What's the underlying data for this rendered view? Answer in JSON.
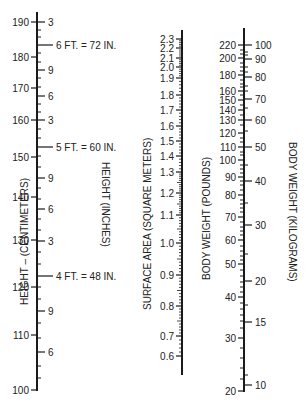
{
  "chart_data": {
    "type": "nomogram",
    "colors": {
      "ink": "#1a1a1a",
      "background": "#ffffff"
    },
    "axes": [
      {
        "id": "height-cm",
        "label": "HEIGHT – (CENTIMETERS)",
        "x": 37,
        "y_top": 12,
        "y_bottom": 391,
        "side": "left",
        "major_ticks": [
          {
            "value": "190",
            "y": 22
          },
          {
            "value": "180",
            "y": 57
          },
          {
            "value": "170",
            "y": 88
          },
          {
            "value": "160",
            "y": 120
          },
          {
            "value": "150",
            "y": 157
          },
          {
            "value": "140",
            "y": 197
          },
          {
            "value": "130",
            "y": 240
          },
          {
            "value": "120",
            "y": 287
          },
          {
            "value": "110",
            "y": 335
          },
          {
            "value": "100",
            "y": 390
          }
        ]
      },
      {
        "id": "height-in",
        "label": "HEIGHT (INCHES)",
        "x": 37,
        "side": "right",
        "major_ticks": [
          {
            "value": "3",
            "y": 22
          },
          {
            "value": "6 FT. = 72 IN.",
            "y": 45,
            "long": true
          },
          {
            "value": "9",
            "y": 70
          },
          {
            "value": "6",
            "y": 96
          },
          {
            "value": "3",
            "y": 120
          },
          {
            "value": "5 FT. = 60 IN.",
            "y": 147,
            "long": true
          },
          {
            "value": "9",
            "y": 178
          },
          {
            "value": "6",
            "y": 209
          },
          {
            "value": "3",
            "y": 241
          },
          {
            "value": "4 FT. = 48 IN.",
            "y": 276,
            "long": true
          },
          {
            "value": "9",
            "y": 311
          },
          {
            "value": "6",
            "y": 352
          }
        ],
        "minor_ticks_y": [
          30,
          37,
          53,
          62,
          78,
          87,
          104,
          112,
          129,
          138,
          156,
          167,
          188,
          199,
          219,
          230,
          252,
          264,
          287,
          299,
          323,
          338,
          366,
          378
        ]
      },
      {
        "id": "surface-area",
        "label": "SURFACE AREA (SQUARE METERS)",
        "x": 182,
        "y_top": 30,
        "y_bottom": 375,
        "side": "left",
        "major_ticks": [
          {
            "value": "2.3",
            "y": 39
          },
          {
            "value": "2.2",
            "y": 48
          },
          {
            "value": "2.1",
            "y": 58
          },
          {
            "value": "2.0",
            "y": 67
          },
          {
            "value": "1.9",
            "y": 78
          },
          {
            "value": "1.8",
            "y": 95
          },
          {
            "value": "1.7",
            "y": 110
          },
          {
            "value": "1.6",
            "y": 126
          },
          {
            "value": "1.5",
            "y": 141
          },
          {
            "value": "1.4",
            "y": 156
          },
          {
            "value": "1.3",
            "y": 172
          },
          {
            "value": "1.2",
            "y": 193
          },
          {
            "value": "1.1",
            "y": 215
          },
          {
            "value": "1.0",
            "y": 243
          },
          {
            "value": "0.9",
            "y": 275
          },
          {
            "value": "0.8",
            "y": 306
          },
          {
            "value": "0.7",
            "y": 336
          },
          {
            "value": "0.6",
            "y": 356
          }
        ]
      },
      {
        "id": "weight-lb",
        "label": "BODY WEIGHT (POUNDS)",
        "x": 244,
        "y_top": 28,
        "y_bottom": 392,
        "side": "left",
        "major_ticks": [
          {
            "value": "220",
            "y": 45
          },
          {
            "value": "200",
            "y": 58
          },
          {
            "value": "180",
            "y": 75
          },
          {
            "value": "160",
            "y": 91
          },
          {
            "value": "150",
            "y": 100
          },
          {
            "value": "140",
            "y": 110
          },
          {
            "value": "130",
            "y": 120
          },
          {
            "value": "120",
            "y": 133
          },
          {
            "value": "110",
            "y": 147
          },
          {
            "value": "100",
            "y": 160
          },
          {
            "value": "90",
            "y": 177
          },
          {
            "value": "80",
            "y": 195
          },
          {
            "value": "70",
            "y": 217
          },
          {
            "value": "60",
            "y": 240
          },
          {
            "value": "50",
            "y": 264
          },
          {
            "value": "40",
            "y": 297
          },
          {
            "value": "30",
            "y": 338
          },
          {
            "value": "20",
            "y": 391
          }
        ],
        "minor_ticks_y": [
          50,
          54,
          63,
          67,
          71,
          80,
          84,
          87,
          95,
          105,
          115,
          125,
          138,
          142,
          152,
          155,
          165,
          169,
          173,
          181,
          185,
          190,
          200,
          204,
          208,
          212,
          222,
          227,
          231,
          235,
          246,
          251,
          256,
          260,
          270,
          276,
          282,
          287,
          292,
          303,
          309,
          315,
          321,
          328,
          348,
          358,
          368,
          379
        ]
      },
      {
        "id": "weight-kg",
        "label": "BODY WEIGHT (KILOGRAMS)",
        "x": 244,
        "side": "right",
        "major_ticks": [
          {
            "value": "100",
            "y": 45
          },
          {
            "value": "90",
            "y": 59
          },
          {
            "value": "80",
            "y": 77
          },
          {
            "value": "70",
            "y": 99
          },
          {
            "value": "60",
            "y": 120
          },
          {
            "value": "50",
            "y": 147
          },
          {
            "value": "40",
            "y": 181
          },
          {
            "value": "30",
            "y": 225
          },
          {
            "value": "20",
            "y": 281
          },
          {
            "value": "15",
            "y": 322
          },
          {
            "value": "10",
            "y": 385
          }
        ],
        "minor_ticks_y": [
          52,
          55,
          67,
          72,
          86,
          91,
          108,
          131,
          165,
          203,
          254,
          305,
          375
        ]
      }
    ],
    "labels": {
      "height_cm": "HEIGHT – (CENTIMETERS)",
      "height_in": "HEIGHT (INCHES)",
      "surface_area": "SURFACE AREA (SQUARE METERS)",
      "weight_lb": "BODY WEIGHT (POUNDS)",
      "weight_kg": "BODY WEIGHT (KILOGRAMS)"
    }
  }
}
